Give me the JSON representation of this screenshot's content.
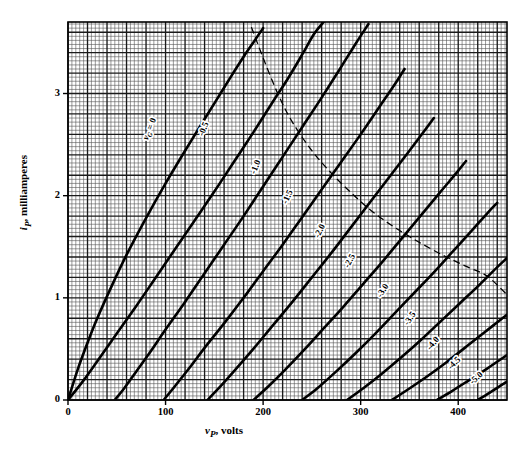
{
  "chart_data": {
    "type": "line",
    "title": "",
    "xlabel": "v_P, volts",
    "ylabel": "i_P, milliamperes",
    "xlabel_main": "v",
    "xlabel_sub": "P",
    "xlabel_unit": ", volts",
    "ylabel_main": "i",
    "ylabel_sub": "P",
    "ylabel_unit": ", milliamperes",
    "xlim": [
      0,
      450
    ],
    "ylim": [
      0,
      3.7
    ],
    "xticks": [
      0,
      100,
      200,
      300,
      400
    ],
    "xticklabels": [
      "0",
      "100",
      "200",
      "300",
      "400"
    ],
    "yticks": [
      0,
      1,
      2,
      3
    ],
    "yticklabels": [
      "0",
      "1",
      "2",
      "3"
    ],
    "grid": true,
    "grid_minor_per_major": 5,
    "grid_major_x_step": 20,
    "grid_major_y_step": 0.2,
    "legend_position": "inline-curve-labels",
    "origin_label": "0",
    "series": [
      {
        "name": "vG = 0",
        "label": "v_G = 0",
        "label_main": "v",
        "label_sub": "G",
        "label_rest": " = 0",
        "label_x": 152,
        "label_y": 130,
        "label_angle": -68,
        "points": [
          [
            0,
            0
          ],
          [
            10,
            0.3
          ],
          [
            20,
            0.56
          ],
          [
            30,
            0.8
          ],
          [
            45,
            1.12
          ],
          [
            60,
            1.42
          ],
          [
            80,
            1.78
          ],
          [
            100,
            2.12
          ],
          [
            120,
            2.44
          ],
          [
            140,
            2.75
          ],
          [
            155,
            2.98
          ],
          [
            168,
            3.18
          ],
          [
            180,
            3.36
          ],
          [
            190,
            3.5
          ],
          [
            200,
            3.64
          ]
        ]
      },
      {
        "name": "vG = -0.5",
        "label": "-0.5",
        "label_x": 206,
        "label_y": 130,
        "label_angle": -68,
        "points": [
          [
            0,
            0
          ],
          [
            15,
            0.18
          ],
          [
            30,
            0.38
          ],
          [
            50,
            0.65
          ],
          [
            70,
            0.92
          ],
          [
            90,
            1.2
          ],
          [
            110,
            1.48
          ],
          [
            130,
            1.76
          ],
          [
            150,
            2.04
          ],
          [
            170,
            2.33
          ],
          [
            190,
            2.62
          ],
          [
            210,
            2.92
          ],
          [
            225,
            3.14
          ],
          [
            240,
            3.38
          ],
          [
            252,
            3.58
          ],
          [
            262,
            3.7
          ]
        ]
      },
      {
        "name": "vG = -1.0",
        "label": "-1.0",
        "label_x": 258,
        "label_y": 168,
        "label_angle": -68,
        "points": [
          [
            48,
            0
          ],
          [
            58,
            0.12
          ],
          [
            70,
            0.28
          ],
          [
            85,
            0.48
          ],
          [
            100,
            0.69
          ],
          [
            120,
            0.96
          ],
          [
            140,
            1.24
          ],
          [
            160,
            1.52
          ],
          [
            180,
            1.8
          ],
          [
            200,
            2.09
          ],
          [
            220,
            2.38
          ],
          [
            240,
            2.67
          ],
          [
            260,
            2.96
          ],
          [
            280,
            3.26
          ],
          [
            295,
            3.49
          ],
          [
            308,
            3.68
          ]
        ]
      },
      {
        "name": "vG = -1.5",
        "label": "-1.5",
        "label_x": 290,
        "label_y": 198,
        "label_angle": -66,
        "points": [
          [
            98,
            0
          ],
          [
            110,
            0.14
          ],
          [
            125,
            0.32
          ],
          [
            140,
            0.51
          ],
          [
            160,
            0.75
          ],
          [
            180,
            1.0
          ],
          [
            200,
            1.26
          ],
          [
            220,
            1.52
          ],
          [
            240,
            1.79
          ],
          [
            260,
            2.06
          ],
          [
            280,
            2.33
          ],
          [
            300,
            2.6
          ],
          [
            320,
            2.88
          ],
          [
            335,
            3.09
          ],
          [
            345,
            3.24
          ]
        ]
      },
      {
        "name": "vG = -2.0",
        "label": "-2.0",
        "label_x": 322,
        "label_y": 232,
        "label_angle": -64,
        "points": [
          [
            143,
            0
          ],
          [
            155,
            0.12
          ],
          [
            170,
            0.28
          ],
          [
            190,
            0.5
          ],
          [
            210,
            0.73
          ],
          [
            230,
            0.96
          ],
          [
            250,
            1.2
          ],
          [
            270,
            1.44
          ],
          [
            290,
            1.69
          ],
          [
            310,
            1.94
          ],
          [
            330,
            2.19
          ],
          [
            350,
            2.44
          ],
          [
            365,
            2.63
          ],
          [
            375,
            2.76
          ]
        ]
      },
      {
        "name": "vG = -2.5",
        "label": "-2.5",
        "label_x": 352,
        "label_y": 262,
        "label_angle": -62,
        "points": [
          [
            190,
            0
          ],
          [
            205,
            0.13
          ],
          [
            222,
            0.29
          ],
          [
            242,
            0.49
          ],
          [
            262,
            0.7
          ],
          [
            282,
            0.91
          ],
          [
            302,
            1.13
          ],
          [
            322,
            1.35
          ],
          [
            342,
            1.58
          ],
          [
            362,
            1.81
          ],
          [
            382,
            2.04
          ],
          [
            398,
            2.22
          ],
          [
            408,
            2.34
          ]
        ]
      },
      {
        "name": "vG = -3.0",
        "label": "-3.0",
        "label_x": 385,
        "label_y": 292,
        "label_angle": -58,
        "points": [
          [
            240,
            0
          ],
          [
            255,
            0.11
          ],
          [
            275,
            0.28
          ],
          [
            295,
            0.46
          ],
          [
            315,
            0.65
          ],
          [
            335,
            0.85
          ],
          [
            355,
            1.05
          ],
          [
            375,
            1.25
          ],
          [
            395,
            1.46
          ],
          [
            415,
            1.67
          ],
          [
            430,
            1.83
          ],
          [
            440,
            1.93
          ]
        ]
      },
      {
        "name": "vG = -3.5",
        "label": "-3.5",
        "label_x": 412,
        "label_y": 320,
        "label_angle": -55,
        "points": [
          [
            286,
            0
          ],
          [
            302,
            0.11
          ],
          [
            322,
            0.26
          ],
          [
            342,
            0.42
          ],
          [
            362,
            0.59
          ],
          [
            382,
            0.77
          ],
          [
            402,
            0.95
          ],
          [
            422,
            1.13
          ],
          [
            440,
            1.3
          ],
          [
            450,
            1.39
          ]
        ]
      },
      {
        "name": "vG = -4.0",
        "label": "-4.0",
        "label_x": 435,
        "label_y": 345,
        "label_angle": -50,
        "points": [
          [
            332,
            0
          ],
          [
            348,
            0.1
          ],
          [
            368,
            0.23
          ],
          [
            388,
            0.37
          ],
          [
            408,
            0.52
          ],
          [
            428,
            0.67
          ],
          [
            448,
            0.82
          ],
          [
            450,
            0.83
          ]
        ]
      },
      {
        "name": "vG = -4.5",
        "label": "-4.5",
        "label_x": 456,
        "label_y": 365,
        "label_angle": -45,
        "points": [
          [
            378,
            0
          ],
          [
            394,
            0.09
          ],
          [
            412,
            0.2
          ],
          [
            430,
            0.31
          ],
          [
            450,
            0.44
          ]
        ]
      },
      {
        "name": "vG = -5.0",
        "label": "-5.0",
        "label_x": 478,
        "label_y": 380,
        "label_angle": -42,
        "points": [
          [
            420,
            0
          ],
          [
            432,
            0.07
          ],
          [
            445,
            0.15
          ],
          [
            450,
            0.18
          ]
        ]
      }
    ],
    "annotations": [
      {
        "name": "constant-power-dashed-curve",
        "style": "dashed",
        "points": [
          [
            188,
            3.65
          ],
          [
            200,
            3.35
          ],
          [
            215,
            3.0
          ],
          [
            230,
            2.72
          ],
          [
            250,
            2.44
          ],
          [
            270,
            2.22
          ],
          [
            290,
            2.03
          ],
          [
            310,
            1.86
          ],
          [
            330,
            1.72
          ],
          [
            350,
            1.6
          ],
          [
            370,
            1.49
          ],
          [
            390,
            1.39
          ],
          [
            410,
            1.3
          ],
          [
            430,
            1.21
          ],
          [
            450,
            1.03
          ]
        ]
      }
    ]
  }
}
